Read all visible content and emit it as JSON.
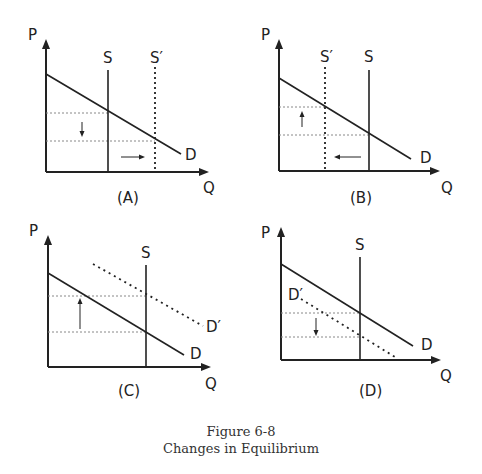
{
  "caption": {
    "figure_number": "Figure 6-8",
    "title": "Changes in Equilibrium"
  },
  "style": {
    "line_color": "#222222",
    "dotted_color": "#888888"
  },
  "panels": [
    {
      "id": "A",
      "label": "(A)",
      "y_axis_label": "P",
      "x_axis_label": "Q",
      "curves": [
        {
          "name": "S",
          "type": "vertical",
          "style": "solid"
        },
        {
          "name": "S′",
          "type": "vertical",
          "style": "dotted"
        },
        {
          "name": "D",
          "type": "downward",
          "style": "solid"
        }
      ],
      "arrows": [
        "price-down",
        "quantity-right"
      ],
      "description": "Supply increases (S shifts right to S′): price falls, quantity rises"
    },
    {
      "id": "B",
      "label": "(B)",
      "y_axis_label": "P",
      "x_axis_label": "Q",
      "curves": [
        {
          "name": "S′",
          "type": "vertical",
          "style": "dotted"
        },
        {
          "name": "S",
          "type": "vertical",
          "style": "solid"
        },
        {
          "name": "D",
          "type": "downward",
          "style": "solid"
        }
      ],
      "arrows": [
        "price-up",
        "quantity-left"
      ],
      "description": "Supply decreases (S shifts left to S′): price rises, quantity falls"
    },
    {
      "id": "C",
      "label": "(C)",
      "y_axis_label": "P",
      "x_axis_label": "Q",
      "curves": [
        {
          "name": "S",
          "type": "vertical",
          "style": "solid"
        },
        {
          "name": "D",
          "type": "downward",
          "style": "solid"
        },
        {
          "name": "D′",
          "type": "downward",
          "style": "dotted"
        }
      ],
      "arrows": [
        "price-up"
      ],
      "description": "Demand increases (D shifts right to D′): price rises with fixed supply"
    },
    {
      "id": "D",
      "label": "(D)",
      "y_axis_label": "P",
      "x_axis_label": "Q",
      "curves": [
        {
          "name": "S",
          "type": "vertical",
          "style": "solid"
        },
        {
          "name": "D",
          "type": "downward",
          "style": "solid"
        },
        {
          "name": "D′",
          "type": "downward",
          "style": "dotted"
        }
      ],
      "arrows": [
        "price-down"
      ],
      "description": "Demand decreases (D shifts left to D′): price falls with fixed supply"
    }
  ]
}
